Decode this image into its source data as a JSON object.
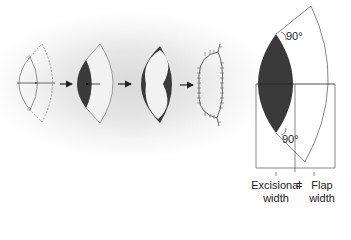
{
  "figure": {
    "stages": [
      {
        "id": "stage-1",
        "description": "planned excision lens with dashed flap outline"
      },
      {
        "id": "stage-2",
        "description": "excised lens (shaded) with flap outline"
      },
      {
        "id": "stage-3",
        "description": "flap advanced into defect"
      },
      {
        "id": "stage-4",
        "description": "sutured closure"
      }
    ],
    "detail": {
      "angle_top": "90°",
      "angle_bottom": "90°",
      "label_left_line1": "Excisional",
      "label_left_line2": "width",
      "equals": "=",
      "label_right_line1": "Flap",
      "label_right_line2": "width"
    },
    "colors": {
      "excision_fill": "#3a3a3a",
      "line": "#555555",
      "background": "#ffffff",
      "glow": "#d9d9d9"
    }
  }
}
